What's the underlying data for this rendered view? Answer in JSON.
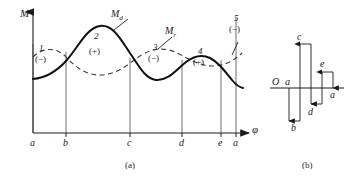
{
  "figure": {
    "panels": [
      {
        "id": "a",
        "caption": "(a)"
      },
      {
        "id": "b",
        "caption": "(b)"
      }
    ]
  },
  "panel_a": {
    "axis": {
      "y_label": "M",
      "x_label": "φ",
      "tick_labels": [
        "a",
        "b",
        "c",
        "d",
        "e",
        "a"
      ]
    },
    "curves": [
      {
        "name": "driving-torque-curve",
        "label": "M",
        "sub": "d",
        "style": "solid"
      },
      {
        "name": "resistance-torque-curve",
        "label": "M",
        "sub": "r",
        "style": "dashed"
      }
    ],
    "areas": [
      {
        "number": "1",
        "sign": "(−)"
      },
      {
        "number": "2",
        "sign": "(+)"
      },
      {
        "number": "3",
        "sign": "(−)"
      },
      {
        "number": "4",
        "sign": "(+)"
      },
      {
        "number": "5",
        "sign": "(−)"
      }
    ]
  },
  "panel_b": {
    "origin_label": "O",
    "bars": [
      {
        "name": "segment-a",
        "label": "a"
      },
      {
        "name": "segment-b",
        "label": "b"
      },
      {
        "name": "segment-c",
        "label": "c"
      },
      {
        "name": "segment-d",
        "label": "d"
      },
      {
        "name": "segment-e",
        "label": "e"
      },
      {
        "name": "segment-a-end",
        "label": "a"
      }
    ]
  },
  "colors": {
    "ink": "#1a1a1a",
    "background": "#ffffff"
  }
}
